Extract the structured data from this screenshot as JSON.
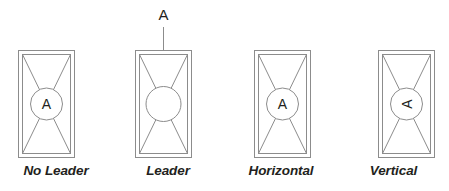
{
  "figure": {
    "background_color": "#ffffff",
    "line_color": "#8c8c8c",
    "text_color": "#231f20"
  },
  "panels": [
    {
      "id": "no-leader",
      "caption": "No Leader",
      "tag_letter": "A",
      "tag_rotation": "0",
      "tag_inside_circle": "yes",
      "has_leader": "no",
      "leader_label": ""
    },
    {
      "id": "leader",
      "caption": "Leader",
      "tag_letter": "",
      "tag_rotation": "0",
      "tag_inside_circle": "no",
      "has_leader": "yes",
      "leader_label": "A"
    },
    {
      "id": "horizontal",
      "caption": "Horizontal",
      "tag_letter": "A",
      "tag_rotation": "0",
      "tag_inside_circle": "yes",
      "has_leader": "no",
      "leader_label": ""
    },
    {
      "id": "vertical",
      "caption": "Vertical",
      "tag_letter": "A",
      "tag_rotation": "-90",
      "tag_inside_circle": "yes",
      "has_leader": "no",
      "leader_label": ""
    }
  ]
}
